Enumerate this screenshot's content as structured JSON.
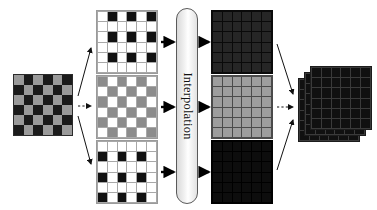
{
  "figure": {
    "process_label": "Interpolation",
    "colors": {
      "mosaic_dark": "#1b1b1b",
      "mosaic_gray": "#9a9a9a",
      "plane_white": "#ffffff",
      "plane_black": "#111111",
      "plane_gray": "#8c8c8c",
      "gridline": "#a8a8a8",
      "out_dark": "#232323",
      "out_darker": "#0b0b0b",
      "out_gray": "#9d9d9d",
      "arrow_solid": "#000000",
      "arrow_thin": "#1a1a1a",
      "background": "#ffffff"
    }
  },
  "input": {
    "name": "cfa-mosaic-input",
    "rows": 6,
    "cols": 6,
    "pattern": [
      [
        "gray",
        "dark",
        "gray",
        "dark",
        "gray",
        "dark"
      ],
      [
        "dark",
        "gray",
        "dark",
        "gray",
        "dark",
        "gray"
      ],
      [
        "gray",
        "dark",
        "gray",
        "dark",
        "gray",
        "dark"
      ],
      [
        "dark",
        "gray",
        "dark",
        "gray",
        "dark",
        "gray"
      ],
      [
        "gray",
        "dark",
        "gray",
        "dark",
        "gray",
        "dark"
      ],
      [
        "dark",
        "gray",
        "dark",
        "gray",
        "dark",
        "gray"
      ]
    ]
  },
  "channels": [
    {
      "name": "channel-plane-top",
      "rows": 6,
      "cols": 6,
      "pattern": [
        [
          "white",
          "black",
          "white",
          "black",
          "white",
          "black"
        ],
        [
          "white",
          "white",
          "white",
          "white",
          "white",
          "white"
        ],
        [
          "white",
          "black",
          "white",
          "black",
          "white",
          "black"
        ],
        [
          "white",
          "white",
          "white",
          "white",
          "white",
          "white"
        ],
        [
          "white",
          "black",
          "white",
          "black",
          "white",
          "black"
        ],
        [
          "white",
          "white",
          "white",
          "white",
          "white",
          "white"
        ]
      ]
    },
    {
      "name": "channel-plane-middle",
      "rows": 6,
      "cols": 6,
      "pattern": [
        [
          "gray",
          "white",
          "gray",
          "white",
          "gray",
          "white"
        ],
        [
          "white",
          "gray",
          "white",
          "gray",
          "white",
          "gray"
        ],
        [
          "gray",
          "white",
          "gray",
          "white",
          "gray",
          "white"
        ],
        [
          "white",
          "gray",
          "white",
          "gray",
          "white",
          "gray"
        ],
        [
          "gray",
          "white",
          "gray",
          "white",
          "gray",
          "white"
        ],
        [
          "white",
          "gray",
          "white",
          "gray",
          "white",
          "gray"
        ]
      ]
    },
    {
      "name": "channel-plane-bottom",
      "rows": 6,
      "cols": 6,
      "pattern": [
        [
          "white",
          "white",
          "white",
          "white",
          "white",
          "white"
        ],
        [
          "black",
          "white",
          "black",
          "white",
          "black",
          "white"
        ],
        [
          "white",
          "white",
          "white",
          "white",
          "white",
          "white"
        ],
        [
          "black",
          "white",
          "black",
          "white",
          "black",
          "white"
        ],
        [
          "white",
          "white",
          "white",
          "white",
          "white",
          "white"
        ],
        [
          "black",
          "white",
          "black",
          "white",
          "black",
          "white"
        ]
      ]
    }
  ],
  "outputs": [
    {
      "name": "interpolated-plane-top",
      "rows": 6,
      "cols": 6,
      "fill": "#262626",
      "gridline": "#0a0a0a"
    },
    {
      "name": "interpolated-plane-middle",
      "rows": 6,
      "cols": 6,
      "fill": "#9d9d9d",
      "gridline": "#4a4a4a"
    },
    {
      "name": "interpolated-plane-bottom",
      "rows": 6,
      "cols": 6,
      "fill": "#0d0d0d",
      "gridline": "#000000"
    }
  ],
  "result": {
    "name": "merged-rgb-stack",
    "layers": 3,
    "rows": 6,
    "cols": 6,
    "fill": "#101010",
    "gridline": "#3a3a3a"
  },
  "arrows": {
    "input_to_channels": [
      "solid-thin-up",
      "dotted-thin",
      "solid-thin-down"
    ],
    "channels_to_process": [
      "solid-thick",
      "solid-thick",
      "solid-thick"
    ],
    "process_to_outputs": [
      "solid-thick",
      "solid-thick",
      "solid-thick"
    ],
    "outputs_to_result": [
      "solid-thin-down",
      "dotted-thin",
      "solid-thin-up"
    ]
  }
}
